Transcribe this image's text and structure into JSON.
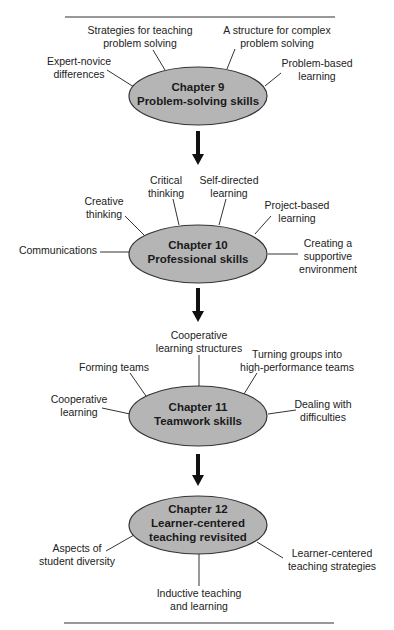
{
  "diagram": {
    "colors": {
      "ellipse_fill": "#b5b5b5",
      "ellipse_stroke": "#333333",
      "line": "#333333",
      "arrow": "#111111",
      "rule": "#333333"
    },
    "chapters": [
      {
        "id": "ch9",
        "title": "Chapter 9",
        "subtitle": "Problem-solving skills",
        "topics": [
          {
            "lines": [
              "Expert-novice",
              "differences"
            ]
          },
          {
            "lines": [
              "Strategies for teaching",
              "problem solving"
            ]
          },
          {
            "lines": [
              "A structure for complex",
              "problem solving"
            ]
          },
          {
            "lines": [
              "Problem-based",
              "learning"
            ]
          }
        ]
      },
      {
        "id": "ch10",
        "title": "Chapter 10",
        "subtitle": "Professional skills",
        "topics": [
          {
            "lines": [
              "Communications"
            ]
          },
          {
            "lines": [
              "Creative",
              "thinking"
            ]
          },
          {
            "lines": [
              "Critical",
              "thinking"
            ]
          },
          {
            "lines": [
              "Self-directed",
              "learning"
            ]
          },
          {
            "lines": [
              "Project-based",
              "learning"
            ]
          },
          {
            "lines": [
              "Creating a",
              "supportive",
              "environment"
            ]
          }
        ]
      },
      {
        "id": "ch11",
        "title": "Chapter 11",
        "subtitle": "Teamwork skills",
        "topics": [
          {
            "lines": [
              "Cooperative",
              "learning"
            ]
          },
          {
            "lines": [
              "Forming teams"
            ]
          },
          {
            "lines": [
              "Cooperative",
              "learning structures"
            ]
          },
          {
            "lines": [
              "Turning groups into",
              "high-performance teams"
            ]
          },
          {
            "lines": [
              "Dealing with",
              "difficulties"
            ]
          }
        ]
      },
      {
        "id": "ch12",
        "title": "Chapter 12",
        "subtitle": "Learner-centered",
        "subtitle2": "teaching revisited",
        "topics": [
          {
            "lines": [
              "Aspects of",
              "student diversity"
            ]
          },
          {
            "lines": [
              "Inductive teaching",
              "and learning"
            ]
          },
          {
            "lines": [
              "Learner-centered",
              "teaching strategies"
            ]
          }
        ]
      }
    ]
  }
}
